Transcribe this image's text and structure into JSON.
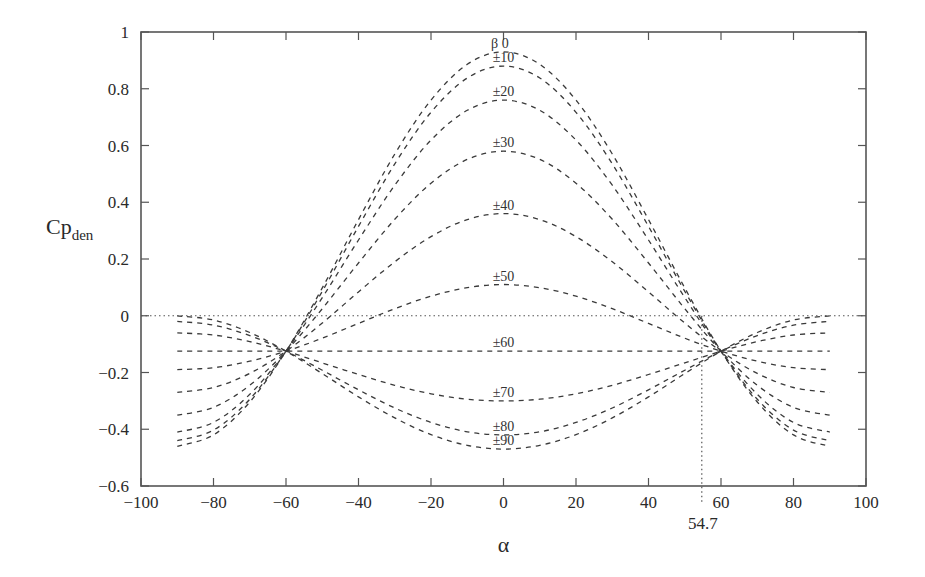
{
  "chart_data": {
    "type": "line",
    "title": "",
    "xlabel": "α",
    "ylabel": "Cp",
    "ylabel_subscript": "den",
    "xlim": [
      -100,
      100
    ],
    "ylim": [
      -0.6,
      1
    ],
    "x_ticks": [
      -100,
      -80,
      -60,
      -40,
      -20,
      0,
      20,
      40,
      60,
      80,
      100
    ],
    "x_tick_labels": [
      "-100",
      "-80",
      "-60",
      "-40",
      "-20",
      "0",
      "20",
      "40",
      "60",
      "80",
      "100"
    ],
    "y_ticks": [
      -0.6,
      -0.4,
      -0.2,
      0,
      0.2,
      0.4,
      0.6,
      0.8,
      1
    ],
    "y_tick_labels": [
      "-0.6",
      "-0.4",
      "-0.2",
      "0",
      "0.2",
      "0.4",
      "0.6",
      "0.8",
      "1"
    ],
    "grid": false,
    "legend": "inline labels at α≈0",
    "reference_lines": {
      "horizontal_zero": 0,
      "vertical_marker": 54.7,
      "vertical_marker_label": "54.7"
    },
    "x": [
      -90,
      -80,
      -70,
      -60,
      -50,
      -40,
      -30,
      -20,
      -10,
      0,
      10,
      20,
      30,
      40,
      50,
      60,
      70,
      80,
      90
    ],
    "series": [
      {
        "name": "β 0",
        "label": "β 0",
        "values": [
          -0.46,
          -0.42,
          -0.304,
          -0.125,
          0.098,
          0.339,
          0.57,
          0.76,
          0.886,
          0.93,
          0.886,
          0.76,
          0.57,
          0.339,
          0.098,
          -0.125,
          -0.304,
          -0.42,
          -0.46
        ]
      },
      {
        "name": "±10",
        "label": "±10",
        "values": [
          -0.44,
          -0.403,
          -0.294,
          -0.125,
          0.086,
          0.315,
          0.535,
          0.717,
          0.838,
          0.88,
          0.838,
          0.717,
          0.535,
          0.315,
          0.086,
          -0.125,
          -0.294,
          -0.403,
          -0.44
        ]
      },
      {
        "name": "±20",
        "label": "±20",
        "values": [
          -0.41,
          -0.376,
          -0.277,
          -0.125,
          0.064,
          0.267,
          0.46,
          0.619,
          0.724,
          0.76,
          0.724,
          0.619,
          0.46,
          0.267,
          0.064,
          -0.125,
          -0.277,
          -0.376,
          -0.41
        ]
      },
      {
        "name": "±30",
        "label": "±30",
        "values": [
          -0.35,
          -0.323,
          -0.245,
          -0.125,
          0.025,
          0.186,
          0.34,
          0.467,
          0.551,
          0.58,
          0.551,
          0.467,
          0.34,
          0.186,
          0.025,
          -0.125,
          -0.245,
          -0.323,
          -0.35
        ]
      },
      {
        "name": "±40",
        "label": "±40",
        "values": [
          -0.27,
          -0.253,
          -0.203,
          -0.125,
          -0.026,
          0.084,
          0.19,
          0.279,
          0.339,
          0.36,
          0.339,
          0.279,
          0.19,
          0.084,
          -0.026,
          -0.125,
          -0.203,
          -0.253,
          -0.27
        ]
      },
      {
        "name": "±50",
        "label": "±50",
        "values": [
          -0.19,
          -0.183,
          -0.16,
          -0.125,
          -0.079,
          -0.027,
          0.025,
          0.069,
          0.099,
          0.11,
          0.099,
          0.069,
          0.025,
          -0.027,
          -0.079,
          -0.125,
          -0.16,
          -0.183,
          -0.19
        ]
      },
      {
        "name": "±60",
        "label": "±60",
        "values": [
          -0.125,
          -0.125,
          -0.125,
          -0.125,
          -0.125,
          -0.125,
          -0.125,
          -0.125,
          -0.125,
          -0.125,
          -0.125,
          -0.125,
          -0.125,
          -0.125,
          -0.125,
          -0.125,
          -0.125,
          -0.125,
          -0.125
        ]
      },
      {
        "name": "±70",
        "label": "±70",
        "values": [
          -0.06,
          -0.068,
          -0.091,
          -0.125,
          -0.166,
          -0.207,
          -0.245,
          -0.275,
          -0.294,
          -0.3,
          -0.294,
          -0.275,
          -0.245,
          -0.207,
          -0.166,
          -0.125,
          -0.091,
          -0.068,
          -0.06
        ]
      },
      {
        "name": "±80",
        "label": "±80",
        "values": [
          -0.02,
          -0.033,
          -0.07,
          -0.125,
          -0.192,
          -0.261,
          -0.325,
          -0.376,
          -0.409,
          -0.42,
          -0.409,
          -0.376,
          -0.325,
          -0.261,
          -0.192,
          -0.125,
          -0.07,
          -0.033,
          -0.02
        ]
      },
      {
        "name": "±90",
        "label": "±90",
        "values": [
          0.0,
          -0.015,
          -0.059,
          -0.125,
          -0.204,
          -0.286,
          -0.36,
          -0.419,
          -0.457,
          -0.47,
          -0.457,
          -0.419,
          -0.36,
          -0.286,
          -0.204,
          -0.125,
          -0.059,
          -0.015,
          0.0
        ]
      }
    ]
  },
  "style": {
    "line_color": "#3a3a3a",
    "axis_color": "#555555",
    "background": "#ffffff"
  },
  "layout": {
    "plot_left": 141,
    "plot_right": 866,
    "plot_top": 32,
    "plot_bottom": 486
  }
}
